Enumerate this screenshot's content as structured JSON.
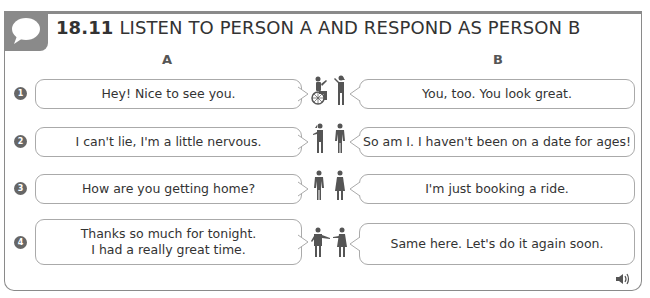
{
  "header": {
    "exercise_number": "18.11",
    "title": "LISTEN TO PERSON A AND RESPOND AS PERSON B",
    "icon": "speech-bubble-icon"
  },
  "columns": {
    "a": "A",
    "b": "B"
  },
  "rows": [
    {
      "number": "1",
      "a": "Hey! Nice to see you.",
      "b": "You, too. You look great.",
      "figures": "wheelchair-user-and-woman"
    },
    {
      "number": "2",
      "a": "I can't lie, I'm a little nervous.",
      "b": "So am I. I haven't been on a date for ages!",
      "figures": "woman-and-man"
    },
    {
      "number": "3",
      "a": "How are you getting home?",
      "b": "I'm just booking a ride.",
      "figures": "man-and-woman"
    },
    {
      "number": "4",
      "a_line1": "Thanks so much for tonight.",
      "a_line2": "I had a really great time.",
      "b": "Same here. Let's do it again soon.",
      "figures": "man-and-woman-gesturing"
    }
  ],
  "footer": {
    "audio_icon": "speaker-icon"
  },
  "colors": {
    "frame": "#8a8a8a",
    "bubble_border": "#aaaaaa",
    "figure": "#555555",
    "text": "#333333"
  }
}
